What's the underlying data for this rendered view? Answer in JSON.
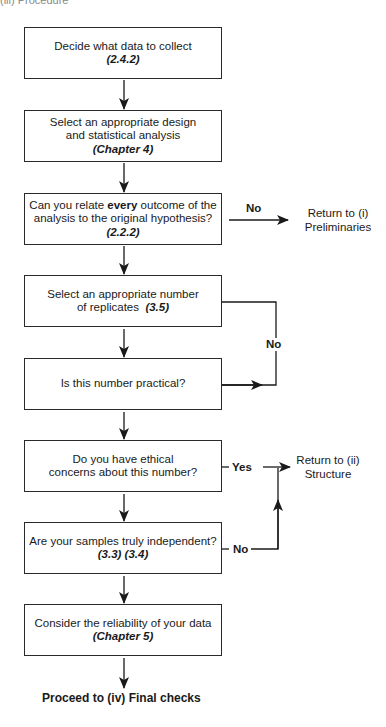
{
  "header": {
    "cut_label": "(iii) Procedure"
  },
  "flowchart": {
    "boxes": [
      {
        "id": "b1",
        "lines": [
          "Decide what data to collect"
        ],
        "ref": "(2.4.2)"
      },
      {
        "id": "b2",
        "lines": [
          "Select an appropriate design",
          "and statistical analysis"
        ],
        "ref": "(Chapter 4)"
      },
      {
        "id": "b3",
        "lines_pre": "Can you relate ",
        "emph": "every",
        "lines_post": " outcome of the",
        "line2": "analysis to the original hypothesis?",
        "ref": "(2.2.2)"
      },
      {
        "id": "b4",
        "line1": "Select an appropriate number",
        "line2": "of replicates",
        "ref": "(3.5)"
      },
      {
        "id": "b5",
        "lines": [
          "Is this number practical?"
        ]
      },
      {
        "id": "b6",
        "lines": [
          "Do you have ethical",
          "concerns about this number?"
        ]
      },
      {
        "id": "b7",
        "lines": [
          "Are your samples truly independent?"
        ],
        "ref": "(3.3) (3.4)"
      },
      {
        "id": "b8",
        "lines": [
          "Consider the reliability of your data"
        ],
        "ref": "(Chapter 5)"
      }
    ],
    "edge_labels": {
      "b3_no": "No",
      "b5_no": "No",
      "b6_yes": "Yes",
      "b7_no": "No"
    },
    "exits": {
      "preliminaries": [
        "Return to (i)",
        "Preliminaries"
      ],
      "structure": [
        "Return to (ii)",
        "Structure"
      ],
      "final": "Proceed to (iv) Final checks"
    },
    "colors": {
      "line": "#1a1a1a",
      "background": "#ffffff"
    }
  }
}
